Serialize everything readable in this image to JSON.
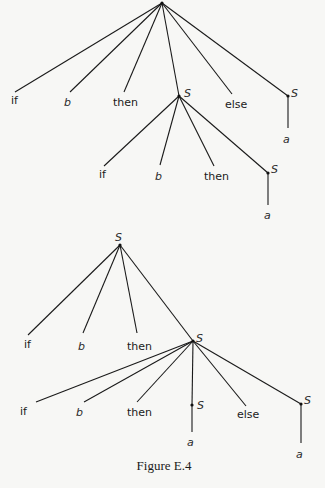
{
  "figure": {
    "caption": "Figure E.4"
  },
  "tree_top": {
    "root": {
      "label": "",
      "x": 162,
      "y": 3
    },
    "children": [
      {
        "id": "t1-if",
        "label": "if",
        "italic": false,
        "edge_to": [
          15,
          92
        ],
        "text_pos": [
          11,
          104
        ]
      },
      {
        "id": "t1-b",
        "label": "b",
        "italic": true,
        "edge_to": [
          70,
          92
        ],
        "text_pos": [
          64,
          106
        ]
      },
      {
        "id": "t1-then",
        "label": "then",
        "italic": false,
        "edge_to": [
          124,
          92
        ],
        "text_pos": [
          113,
          106
        ]
      },
      {
        "id": "t1-S-mid",
        "label": "S",
        "italic": true,
        "edge_to": [
          179,
          96
        ],
        "text_pos": [
          184,
          97
        ]
      },
      {
        "id": "t1-else",
        "label": "else",
        "italic": false,
        "edge_to": [
          232,
          94
        ],
        "text_pos": [
          225,
          108
        ]
      },
      {
        "id": "t1-S-right",
        "label": "S",
        "italic": true,
        "edge_to": [
          288,
          96
        ],
        "text_pos": [
          291,
          97
        ]
      }
    ],
    "subtrees": [
      {
        "parent": "t1-S-mid",
        "from": [
          179,
          96
        ],
        "children": [
          {
            "id": "t1m-if",
            "label": "if",
            "italic": false,
            "edge_to": [
              104,
              166
            ],
            "text_pos": [
              99,
              178
            ]
          },
          {
            "id": "t1m-b",
            "label": "b",
            "italic": true,
            "edge_to": [
              160,
              165
            ],
            "text_pos": [
              155,
              180
            ]
          },
          {
            "id": "t1m-then",
            "label": "then",
            "italic": false,
            "edge_to": [
              214,
              166
            ],
            "text_pos": [
              204,
              180
            ]
          },
          {
            "id": "t1m-S",
            "label": "S",
            "italic": true,
            "edge_to": [
              268,
              173
            ],
            "text_pos": [
              271,
              173
            ]
          }
        ]
      },
      {
        "parent": "t1m-S",
        "from": [
          268,
          173
        ],
        "children": [
          {
            "id": "t1m-a",
            "label": "a",
            "italic": true,
            "edge_to": [
              268,
              205
            ],
            "text_pos": [
              264,
              219
            ]
          }
        ]
      },
      {
        "parent": "t1-S-right",
        "from": [
          288,
          96
        ],
        "children": [
          {
            "id": "t1r-a",
            "label": "a",
            "italic": true,
            "edge_to": [
              288,
              128
            ],
            "text_pos": [
              283,
              143
            ]
          }
        ]
      }
    ]
  },
  "tree_bottom": {
    "root": {
      "label": "S",
      "x": 120,
      "y": 245,
      "text_pos": [
        115,
        241
      ]
    },
    "children": [
      {
        "id": "t2-if",
        "label": "if",
        "italic": false,
        "edge_to": [
          28,
          335
        ],
        "text_pos": [
          24,
          348
        ]
      },
      {
        "id": "t2-b",
        "label": "b",
        "italic": true,
        "edge_to": [
          83,
          333
        ],
        "text_pos": [
          78,
          350
        ]
      },
      {
        "id": "t2-then",
        "label": "then",
        "italic": false,
        "edge_to": [
          137,
          333
        ],
        "text_pos": [
          127,
          350
        ]
      },
      {
        "id": "t2-S-mid",
        "label": "S",
        "italic": true,
        "edge_to": [
          193,
          341
        ],
        "text_pos": [
          196,
          342
        ]
      }
    ],
    "subtrees": [
      {
        "parent": "t2-S-mid",
        "from": [
          193,
          341
        ],
        "children": [
          {
            "id": "t2m-if",
            "label": "if",
            "italic": false,
            "edge_to": [
              36,
              402
            ],
            "text_pos": [
              20,
              415
            ]
          },
          {
            "id": "t2m-b",
            "label": "b",
            "italic": true,
            "edge_to": [
              84,
              402
            ],
            "text_pos": [
              76,
              416
            ]
          },
          {
            "id": "t2m-then",
            "label": "then",
            "italic": false,
            "edge_to": [
              137,
              402
            ],
            "text_pos": [
              127,
              416
            ]
          },
          {
            "id": "t2m-S",
            "label": "S",
            "italic": true,
            "edge_to": [
              192,
              405
            ],
            "text_pos": [
              197,
              409
            ]
          },
          {
            "id": "t2m-else",
            "label": "else",
            "italic": false,
            "edge_to": [
              246,
              406
            ],
            "text_pos": [
              237,
              418
            ]
          },
          {
            "id": "t2m-S-right",
            "label": "S",
            "italic": true,
            "edge_to": [
              301,
              404
            ],
            "text_pos": [
              304,
              404
            ]
          }
        ]
      },
      {
        "parent": "t2m-S",
        "from": [
          192,
          405
        ],
        "children": [
          {
            "id": "t2m-a",
            "label": "a",
            "italic": true,
            "edge_to": [
              192,
              432
            ],
            "text_pos": [
              187,
              446
            ]
          }
        ]
      },
      {
        "parent": "t2m-S-right",
        "from": [
          301,
          404
        ],
        "children": [
          {
            "id": "t2r-a",
            "label": "a",
            "italic": true,
            "edge_to": [
              301,
              443
            ],
            "text_pos": [
              296,
              458
            ]
          }
        ]
      }
    ]
  },
  "colors": {
    "background": "#f7f7f5",
    "ink": "#1a1a1a"
  }
}
